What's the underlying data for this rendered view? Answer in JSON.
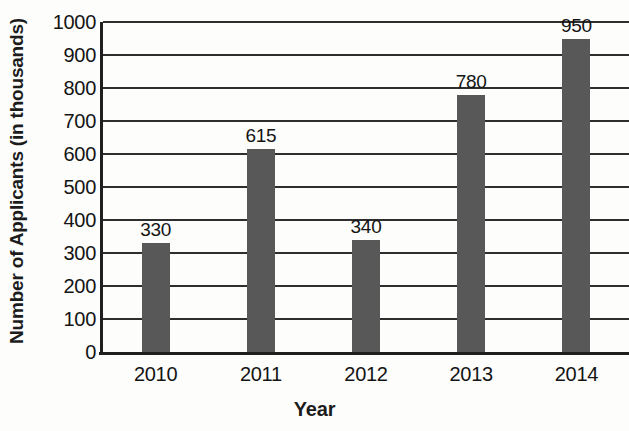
{
  "chart_data": {
    "type": "bar",
    "title": "",
    "xlabel": "Year",
    "ylabel": "Number of Applicants (in thousands)",
    "categories": [
      "2010",
      "2011",
      "2012",
      "2013",
      "2014"
    ],
    "values": [
      330,
      615,
      340,
      780,
      950
    ],
    "data_labels": [
      "330",
      "615",
      "340",
      "780",
      "950"
    ],
    "ylim": [
      0,
      1000
    ],
    "ytick_labels": [
      "0",
      "100",
      "200",
      "300",
      "400",
      "500",
      "600",
      "700",
      "800",
      "900",
      "1000"
    ],
    "ytick_values": [
      0,
      100,
      200,
      300,
      400,
      500,
      600,
      700,
      800,
      900,
      1000
    ],
    "grid": true,
    "legend": "none",
    "series": [
      {
        "name": "Number of Applicants",
        "values": [
          330,
          615,
          340,
          780,
          950
        ]
      }
    ],
    "bar_color": "#585858",
    "grid_color": "#2e2e2e",
    "axis_color": "#1f1f1f",
    "background_color": "#fdfdfc"
  }
}
